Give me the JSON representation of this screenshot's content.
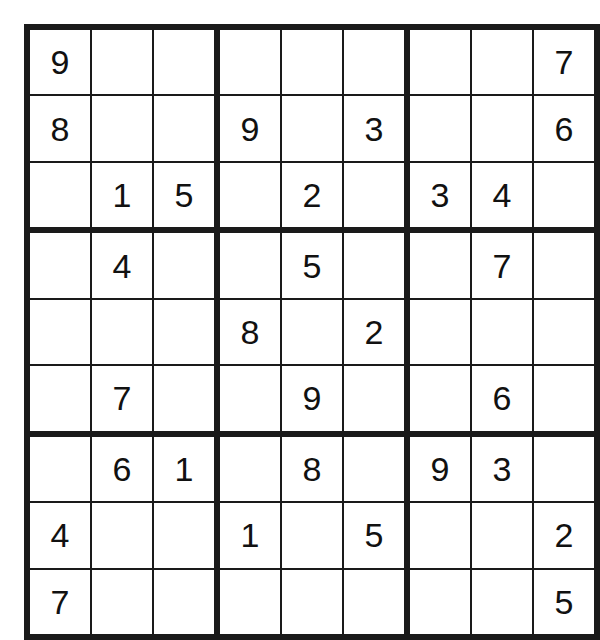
{
  "puzzle": {
    "type": "sudoku",
    "size": 9,
    "box_size": 3,
    "empty_marker": "",
    "colors": {
      "background": "#ffffff",
      "cell_background": "#ffffff",
      "grid_line": "#1a1a1a",
      "digit": "#111111"
    },
    "givens_count": 29,
    "rows": [
      [
        "9",
        "",
        "",
        "",
        "",
        "",
        "",
        "",
        "7"
      ],
      [
        "8",
        "",
        "",
        "9",
        "",
        "3",
        "",
        "",
        "6"
      ],
      [
        "",
        "1",
        "5",
        "",
        "2",
        "",
        "3",
        "4",
        ""
      ],
      [
        "",
        "4",
        "",
        "",
        "5",
        "",
        "",
        "7",
        ""
      ],
      [
        "",
        "",
        "",
        "8",
        "",
        "2",
        "",
        "",
        ""
      ],
      [
        "",
        "7",
        "",
        "",
        "9",
        "",
        "",
        "6",
        ""
      ],
      [
        "",
        "6",
        "1",
        "",
        "8",
        "",
        "9",
        "3",
        ""
      ],
      [
        "4",
        "",
        "",
        "1",
        "",
        "5",
        "",
        "",
        "2"
      ],
      [
        "7",
        "",
        "",
        "",
        "",
        "",
        "",
        "",
        "5"
      ]
    ]
  }
}
